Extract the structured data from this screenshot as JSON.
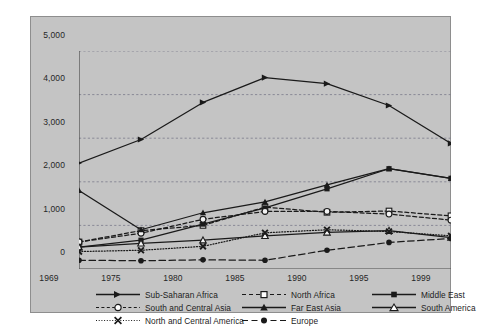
{
  "chart_data": {
    "type": "line",
    "title": "",
    "subtitle": "",
    "xlabel": "",
    "ylabel": "",
    "x": [
      1969,
      1975,
      1980,
      1985,
      1990,
      1995,
      1999
    ],
    "xtick_labels": [
      "1969",
      "1975",
      "1980",
      "1985",
      "1990",
      "1995",
      "1999"
    ],
    "ytick_labels": [
      "0",
      "1,000",
      "2,000",
      "3,000",
      "4,000",
      "5,000"
    ],
    "yticks": [
      0,
      1000,
      2000,
      3000,
      4000,
      5000
    ],
    "ylim": [
      0,
      5000
    ],
    "grid": "horizontal-dashed",
    "legend_position": "below-axis",
    "series": [
      {
        "name": "Sub-Saharan Africa",
        "values": [
          2430,
          2970,
          3820,
          4390,
          4250,
          3750,
          2880
        ],
        "line_style": "solid",
        "marker": "triangle-right",
        "color": "#1a1a1a"
      },
      {
        "name": "North Africa",
        "values": [
          620,
          880,
          1000,
          1420,
          1300,
          1330,
          1220
        ],
        "line_style": "dashed",
        "marker": "open-square",
        "color": "#1a1a1a"
      },
      {
        "name": "Middle East",
        "values": [
          500,
          660,
          1030,
          1400,
          1840,
          2300,
          2080
        ],
        "line_style": "solid",
        "marker": "filled-square",
        "color": "#1a1a1a"
      },
      {
        "name": "South and Central Asia",
        "values": [
          620,
          820,
          1140,
          1320,
          1320,
          1260,
          1120
        ],
        "line_style": "dashed",
        "marker": "open-circle",
        "color": "#1a1a1a"
      },
      {
        "name": "Far East Asia",
        "values": [
          1800,
          900,
          1290,
          1540,
          1930,
          2300,
          2080
        ],
        "line_style": "solid",
        "marker": "filled-triangle",
        "color": "#1a1a1a"
      },
      {
        "name": "South America",
        "values": [
          500,
          590,
          660,
          760,
          840,
          880,
          720
        ],
        "line_style": "solid",
        "marker": "open-triangle",
        "color": "#1a1a1a"
      },
      {
        "name": "North and Central America",
        "values": [
          400,
          430,
          520,
          830,
          900,
          860,
          760
        ],
        "line_style": "dotted",
        "marker": "cross-x",
        "color": "#1a1a1a"
      },
      {
        "name": "Europe",
        "values": [
          200,
          190,
          210,
          200,
          430,
          610,
          700
        ],
        "line_style": "long-dashed",
        "marker": "filled-circle",
        "color": "#1a1a1a"
      }
    ]
  },
  "legend": {
    "entries": [
      {
        "label": "Sub-Saharan Africa"
      },
      {
        "label": "North Africa"
      },
      {
        "label": "Middle East"
      },
      {
        "label": "South and Central Asia"
      },
      {
        "label": "Far East Asia"
      },
      {
        "label": "South America"
      },
      {
        "label": "North and Central America"
      },
      {
        "label": "Europe"
      }
    ]
  }
}
